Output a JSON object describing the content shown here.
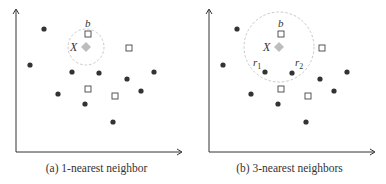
{
  "figure": {
    "panels": [
      {
        "id": "a",
        "caption": "(a) 1-nearest neighbor",
        "k": 1,
        "circle_radius": 18,
        "neighbor_labels": []
      },
      {
        "id": "b",
        "caption": "(b) 3-nearest neighbors",
        "k": 3,
        "circle_radius": 35,
        "neighbor_labels": [
          "r1",
          "r2"
        ]
      }
    ],
    "labels": {
      "query": "X",
      "square_neighbor": "b",
      "r1_base": "r",
      "r1_sub": "1",
      "r2_base": "r",
      "r2_sub": "2"
    },
    "query_point": {
      "x": 86,
      "y": 47,
      "shape": "diamond",
      "color": "#bdbdbd"
    },
    "circle_points": [
      {
        "x": 44,
        "y": 29
      },
      {
        "x": 30,
        "y": 65
      },
      {
        "x": 72,
        "y": 72
      },
      {
        "x": 99,
        "y": 73
      },
      {
        "x": 127,
        "y": 79
      },
      {
        "x": 154,
        "y": 72
      },
      {
        "x": 58,
        "y": 94
      },
      {
        "x": 141,
        "y": 91
      },
      {
        "x": 85,
        "y": 104
      },
      {
        "x": 113,
        "y": 122
      }
    ],
    "square_points": [
      {
        "x": 88,
        "y": 34,
        "label": "b"
      },
      {
        "x": 129,
        "y": 48
      },
      {
        "x": 88,
        "y": 89
      },
      {
        "x": 115,
        "y": 96
      }
    ],
    "colors": {
      "dot": "#333333",
      "square_stroke": "#444444",
      "axis": "#333333",
      "circle": "#c8c8c8",
      "query": "#bdbdbd"
    }
  }
}
